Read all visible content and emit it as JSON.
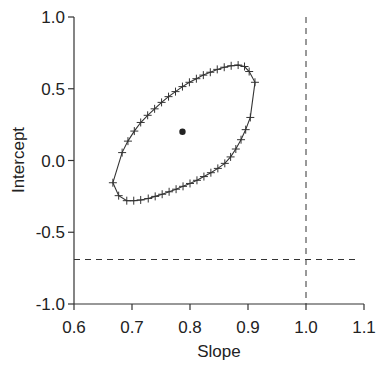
{
  "chart_data": {
    "type": "scatter",
    "title": "",
    "xlabel": "Slope",
    "ylabel": "Intercept",
    "xlim": [
      0.6,
      1.1
    ],
    "ylim": [
      -1.0,
      1.0
    ],
    "x_ticks": [
      "0.6",
      "0.7",
      "0.8",
      "0.9",
      "1.0",
      "1.1"
    ],
    "y_ticks": [
      "1.0",
      "0.5",
      "0.0",
      "-0.5",
      "-1.0"
    ],
    "grid": false,
    "legend": null,
    "point_estimate": {
      "slope": 0.787,
      "intercept": 0.2
    },
    "reference_lines": {
      "vertical_x": 1.0,
      "horizontal_y": -0.69
    },
    "confidence_ellipse": {
      "marker": "+",
      "points": [
        [
          0.667,
          -0.155
        ],
        [
          0.677,
          -0.245
        ],
        [
          0.691,
          -0.28
        ],
        [
          0.703,
          -0.28
        ],
        [
          0.715,
          -0.275
        ],
        [
          0.728,
          -0.265
        ],
        [
          0.74,
          -0.25
        ],
        [
          0.752,
          -0.235
        ],
        [
          0.764,
          -0.218
        ],
        [
          0.776,
          -0.2
        ],
        [
          0.788,
          -0.18
        ],
        [
          0.8,
          -0.16
        ],
        [
          0.812,
          -0.138
        ],
        [
          0.824,
          -0.112
        ],
        [
          0.836,
          -0.085
        ],
        [
          0.848,
          -0.055
        ],
        [
          0.86,
          -0.02
        ],
        [
          0.87,
          0.025
        ],
        [
          0.879,
          0.08
        ],
        [
          0.888,
          0.145
        ],
        [
          0.896,
          0.215
        ],
        [
          0.904,
          0.3
        ],
        [
          0.912,
          0.545
        ],
        [
          0.902,
          0.62
        ],
        [
          0.894,
          0.655
        ],
        [
          0.883,
          0.665
        ],
        [
          0.871,
          0.66
        ],
        [
          0.859,
          0.65
        ],
        [
          0.847,
          0.635
        ],
        [
          0.835,
          0.615
        ],
        [
          0.823,
          0.595
        ],
        [
          0.811,
          0.57
        ],
        [
          0.799,
          0.545
        ],
        [
          0.787,
          0.515
        ],
        [
          0.775,
          0.48
        ],
        [
          0.763,
          0.445
        ],
        [
          0.751,
          0.405
        ],
        [
          0.739,
          0.36
        ],
        [
          0.727,
          0.315
        ],
        [
          0.715,
          0.265
        ],
        [
          0.704,
          0.205
        ],
        [
          0.693,
          0.135
        ],
        [
          0.683,
          0.055
        ],
        [
          0.667,
          -0.155
        ]
      ]
    }
  }
}
